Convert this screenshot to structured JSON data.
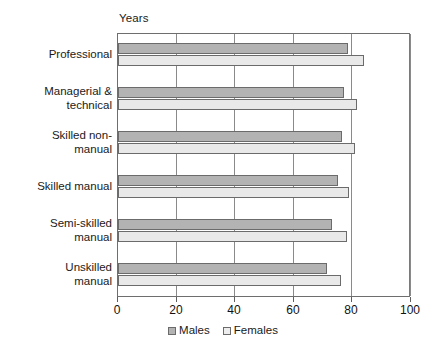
{
  "chart_data": {
    "type": "bar",
    "orientation": "horizontal",
    "title": "",
    "xlabel": "",
    "ylabel": "",
    "unit_label": "Years",
    "xlim": [
      0,
      100
    ],
    "xticks": [
      0,
      20,
      40,
      60,
      80,
      100
    ],
    "xtick_labels": [
      "0",
      "20",
      "40",
      "60",
      "80",
      "100"
    ],
    "grid": true,
    "grid_axis": "x",
    "legend_position": "bottom",
    "categories": [
      "Professional",
      "Managerial & technical",
      "Skilled non-manual",
      "Skilled manual",
      "Semi-skilled manual",
      "Unskilled manual"
    ],
    "category_lines": [
      [
        "Professional"
      ],
      [
        "Managerial &",
        "technical"
      ],
      [
        "Skilled non-",
        "manual"
      ],
      [
        "Skilled manual"
      ],
      [
        "Semi-skilled",
        "manual"
      ],
      [
        "Unskilled",
        "manual"
      ]
    ],
    "series": [
      {
        "name": "Males",
        "color": "#b3b3b3",
        "values": [
          78.5,
          77.0,
          76.5,
          75.0,
          73.0,
          71.5
        ]
      },
      {
        "name": "Females",
        "color": "#e9e9e9",
        "values": [
          84.0,
          81.5,
          81.0,
          79.0,
          78.0,
          76.0
        ]
      }
    ]
  },
  "legend": {
    "entries": [
      {
        "label": "Males"
      },
      {
        "label": "Females"
      }
    ]
  }
}
